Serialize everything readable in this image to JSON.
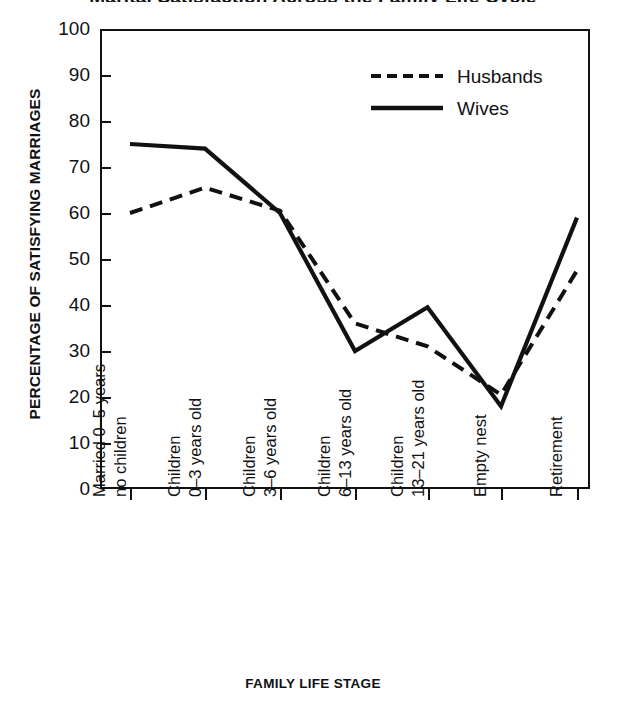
{
  "chart_data": {
    "type": "line",
    "title": "Marital Satisfaction Across the Family Life Cycle",
    "xlabel": "FAMILY LIFE STAGE",
    "ylabel": "PERCENTAGE OF SATISFYING MARRIAGES",
    "ylim": [
      0,
      100
    ],
    "ytick_step": 10,
    "yticks": [
      100,
      90,
      80,
      70,
      60,
      50,
      40,
      30,
      20,
      10,
      0
    ],
    "grid": false,
    "legend_position": "top-right",
    "categories": [
      {
        "line1": "Married 0–5 years",
        "line2": "no children"
      },
      {
        "line1": "Children",
        "line2": "0–3 years old"
      },
      {
        "line1": "Children",
        "line2": "3–6 years old"
      },
      {
        "line1": "Children",
        "line2": "6–13 years old"
      },
      {
        "line1": "Children",
        "line2": "13–21 years old"
      },
      {
        "line1": "Empty nest",
        "line2": ""
      },
      {
        "line1": "Retirement",
        "line2": ""
      }
    ],
    "series": [
      {
        "name": "Husbands",
        "style": "dashed",
        "color": "#111111",
        "values": [
          60,
          65.5,
          60.5,
          36,
          31,
          20.5,
          47.5
        ]
      },
      {
        "name": "Wives",
        "style": "solid",
        "color": "#111111",
        "values": [
          75,
          74,
          60,
          30,
          39.5,
          18,
          59
        ]
      }
    ]
  },
  "legend": {
    "items": [
      {
        "label": "Husbands",
        "style": "dashed"
      },
      {
        "label": "Wives",
        "style": "solid"
      }
    ]
  }
}
